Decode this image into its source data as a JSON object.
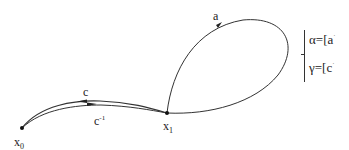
{
  "diagram": {
    "type": "path-loop-diagram",
    "points": {
      "x0": {
        "label": "x",
        "sub": "0"
      },
      "x1": {
        "label": "x",
        "sub": "1"
      }
    },
    "paths": {
      "a": {
        "label": "a"
      },
      "c": {
        "label": "c"
      },
      "c_inv": {
        "label": "c",
        "sup": "-1"
      }
    },
    "equations": {
      "alpha": {
        "lhs": "α",
        "eq": "=[",
        "rhs": "a",
        "tail": "·"
      },
      "gamma": {
        "lhs": "γ",
        "eq": "=[",
        "rhs": "c",
        "tail": "·"
      }
    },
    "colors": {
      "stroke": "#333333",
      "text": "#222222",
      "background": "#ffffff"
    }
  }
}
